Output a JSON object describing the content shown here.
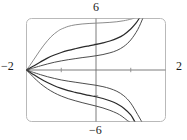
{
  "widget": {
    "name": "graphing-calculator-plot",
    "frame": {
      "x_left_px": 26.5,
      "y_top_px": 18.5,
      "x_right_px": 165.5,
      "y_bottom_px": 121.5,
      "corner_radius_px": 5,
      "stroke_color": "#b9b9b9"
    }
  },
  "axis_labels": {
    "y_max": "6",
    "y_min": "−6",
    "x_min": "−2",
    "x_max": "2"
  },
  "colors": {
    "frame": "#b9b9b9",
    "axis": "#6e6e6e",
    "tick": "#8a8a8a",
    "curve_dark": "#2a2a2a",
    "curve_mid": "#4d4d4d",
    "curve_light": "#8c8c8c",
    "text": "#1a1a1a",
    "background": "#ffffff"
  },
  "chart_data": {
    "type": "line",
    "title": "",
    "xlabel": "",
    "ylabel": "",
    "xlim": [
      -2,
      2
    ],
    "ylim": [
      -6,
      6
    ],
    "grid": false,
    "legend": "none",
    "xticks": [
      -1,
      0,
      1
    ],
    "yticks": [
      -3,
      0,
      3
    ],
    "axis_tick_labels": {
      "x": [
        "−2",
        "2"
      ],
      "y": [
        "−6",
        "6"
      ]
    },
    "common_point": [
      -2,
      0
    ],
    "series": [
      {
        "name": "c1-upper-outer",
        "shade": "curve_light",
        "width_px": 1.0,
        "points": [
          [
            -2.0,
            0.0
          ],
          [
            -1.9,
            0.55
          ],
          [
            -1.8,
            1.15
          ],
          [
            -1.7,
            1.75
          ],
          [
            -1.6,
            2.35
          ],
          [
            -1.5,
            2.9
          ],
          [
            -1.4,
            3.4
          ],
          [
            -1.3,
            3.85
          ],
          [
            -1.2,
            4.22
          ],
          [
            -1.1,
            4.52
          ],
          [
            -1.0,
            4.76
          ],
          [
            -0.8,
            5.08
          ],
          [
            -0.6,
            5.26
          ],
          [
            -0.4,
            5.36
          ],
          [
            -0.2,
            5.42
          ],
          [
            0.0,
            5.46
          ],
          [
            0.2,
            5.5
          ],
          [
            0.4,
            5.55
          ],
          [
            0.6,
            5.62
          ],
          [
            0.8,
            5.74
          ],
          [
            1.0,
            5.92
          ],
          [
            1.1,
            6.05
          ]
        ]
      },
      {
        "name": "c2-upper-mid",
        "shade": "curve_dark",
        "width_px": 1.2,
        "points": [
          [
            -2.0,
            0.0
          ],
          [
            -1.9,
            0.22
          ],
          [
            -1.8,
            0.46
          ],
          [
            -1.6,
            0.94
          ],
          [
            -1.4,
            1.38
          ],
          [
            -1.2,
            1.74
          ],
          [
            -1.0,
            2.04
          ],
          [
            -0.8,
            2.28
          ],
          [
            -0.6,
            2.48
          ],
          [
            -0.4,
            2.66
          ],
          [
            -0.2,
            2.82
          ],
          [
            0.0,
            2.98
          ],
          [
            0.2,
            3.16
          ],
          [
            0.4,
            3.38
          ],
          [
            0.6,
            3.68
          ],
          [
            0.8,
            4.12
          ],
          [
            1.0,
            4.78
          ],
          [
            1.15,
            5.45
          ],
          [
            1.25,
            6.05
          ]
        ]
      },
      {
        "name": "c3-upper-inner",
        "shade": "curve_mid",
        "width_px": 1.0,
        "points": [
          [
            -2.0,
            0.0
          ],
          [
            -1.9,
            0.12
          ],
          [
            -1.8,
            0.24
          ],
          [
            -1.6,
            0.48
          ],
          [
            -1.4,
            0.7
          ],
          [
            -1.2,
            0.9
          ],
          [
            -1.0,
            1.06
          ],
          [
            -0.8,
            1.2
          ],
          [
            -0.6,
            1.32
          ],
          [
            -0.4,
            1.44
          ],
          [
            -0.2,
            1.54
          ],
          [
            0.0,
            1.66
          ],
          [
            0.2,
            1.8
          ],
          [
            0.4,
            2.0
          ],
          [
            0.6,
            2.28
          ],
          [
            0.8,
            2.74
          ],
          [
            1.0,
            3.5
          ],
          [
            1.2,
            4.7
          ],
          [
            1.35,
            6.05
          ]
        ]
      },
      {
        "name": "c4-lower-inner",
        "shade": "curve_mid",
        "width_px": 1.0,
        "points": [
          [
            -2.0,
            0.0
          ],
          [
            -1.9,
            -0.14
          ],
          [
            -1.8,
            -0.28
          ],
          [
            -1.6,
            -0.54
          ],
          [
            -1.4,
            -0.78
          ],
          [
            -1.2,
            -0.98
          ],
          [
            -1.0,
            -1.16
          ],
          [
            -0.8,
            -1.3
          ],
          [
            -0.6,
            -1.42
          ],
          [
            -0.4,
            -1.54
          ],
          [
            -0.2,
            -1.66
          ],
          [
            0.0,
            -1.78
          ],
          [
            0.2,
            -1.94
          ],
          [
            0.4,
            -2.16
          ],
          [
            0.6,
            -2.48
          ],
          [
            0.8,
            -3.0
          ],
          [
            1.0,
            -3.86
          ],
          [
            1.2,
            -5.2
          ],
          [
            1.32,
            -6.05
          ]
        ]
      },
      {
        "name": "c5-lower-mid",
        "shade": "curve_dark",
        "width_px": 1.2,
        "points": [
          [
            -2.0,
            0.0
          ],
          [
            -1.9,
            -0.26
          ],
          [
            -1.8,
            -0.52
          ],
          [
            -1.6,
            -1.02
          ],
          [
            -1.4,
            -1.46
          ],
          [
            -1.2,
            -1.84
          ],
          [
            -1.0,
            -2.14
          ],
          [
            -0.8,
            -2.4
          ],
          [
            -0.6,
            -2.6
          ],
          [
            -0.4,
            -2.78
          ],
          [
            -0.2,
            -2.96
          ],
          [
            0.0,
            -3.12
          ],
          [
            0.2,
            -3.32
          ],
          [
            0.4,
            -3.58
          ],
          [
            0.6,
            -3.94
          ],
          [
            0.8,
            -4.46
          ],
          [
            1.0,
            -5.24
          ],
          [
            1.12,
            -6.05
          ]
        ]
      },
      {
        "name": "c6-lower-outer",
        "shade": "curve_mid",
        "width_px": 1.0,
        "points": [
          [
            -2.0,
            0.0
          ],
          [
            -1.9,
            -0.42
          ],
          [
            -1.8,
            -0.84
          ],
          [
            -1.6,
            -1.58
          ],
          [
            -1.4,
            -2.18
          ],
          [
            -1.2,
            -2.66
          ],
          [
            -1.0,
            -3.04
          ],
          [
            -0.8,
            -3.34
          ],
          [
            -0.6,
            -3.58
          ],
          [
            -0.4,
            -3.8
          ],
          [
            -0.2,
            -4.0
          ],
          [
            0.0,
            -4.2
          ],
          [
            0.2,
            -4.42
          ],
          [
            0.4,
            -4.7
          ],
          [
            0.6,
            -5.04
          ],
          [
            0.75,
            -5.4
          ],
          [
            0.9,
            -5.88
          ],
          [
            0.97,
            -6.05
          ]
        ]
      }
    ]
  }
}
